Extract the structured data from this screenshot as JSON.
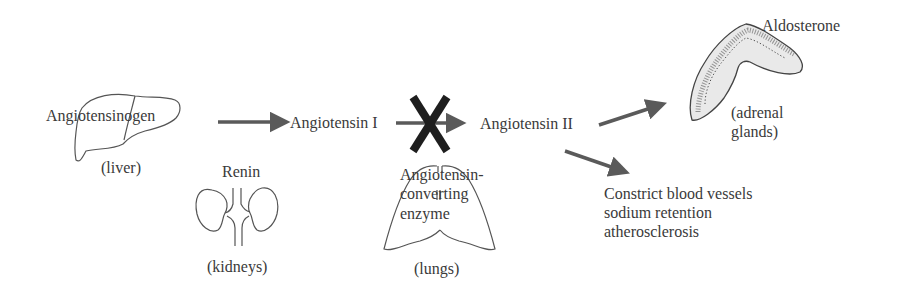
{
  "diagram": {
    "colors": {
      "arrow": "#5a5a5a",
      "block_mark": "#1e1e1e",
      "outline": "#555555",
      "text": "#3a3a3a"
    },
    "nodes": {
      "angiotensinogen": {
        "label": "Angiotensinogen",
        "organ": "(liver)"
      },
      "renin": {
        "label": "Renin",
        "organ": "(kidneys)"
      },
      "angiotensin_i": {
        "label": "Angiotensin I"
      },
      "ace": {
        "label_line1": "Angiotensin-",
        "label_line2": "converting",
        "label_line3": "enzyme",
        "organ": "(lungs)"
      },
      "angiotensin_ii": {
        "label": "Angiotensin II"
      },
      "aldosterone": {
        "label": "Aldosterone",
        "organ_line1": "(adrenal",
        "organ_line2": "glands)"
      },
      "effects": {
        "line1": "Constrict blood vessels",
        "line2": "sodium retention",
        "line3": "atherosclerosis"
      }
    },
    "edges": [
      {
        "from": "angiotensinogen",
        "to": "angiotensin_i"
      },
      {
        "from": "angiotensin_i",
        "to": "angiotensin_ii",
        "blocked": true
      },
      {
        "from": "angiotensin_ii",
        "to": "aldosterone"
      },
      {
        "from": "angiotensin_ii",
        "to": "effects"
      }
    ]
  }
}
